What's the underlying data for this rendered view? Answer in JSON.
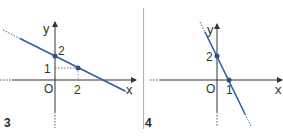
{
  "colors": {
    "line": "#2f5f9e",
    "point": "#2a4f8a",
    "axis": "#333333",
    "divider": "#b5b5b5",
    "dotted": "#555555"
  },
  "graph3": {
    "figure_label": "3",
    "x_axis_label": "x",
    "y_axis_label": "y",
    "origin_label": "O",
    "y_tick_2": "2",
    "y_tick_1": "1",
    "x_tick_2": "2",
    "points": [
      {
        "x": 0,
        "y": 2
      },
      {
        "x": 2,
        "y": 1
      }
    ]
  },
  "graph4": {
    "figure_label": "4",
    "x_axis_label": "x",
    "y_axis_label": "y",
    "origin_label": "O",
    "y_tick_2": "2",
    "x_tick_1": "1",
    "points": [
      {
        "x": 0,
        "y": 2
      },
      {
        "x": 1,
        "y": 0
      }
    ]
  }
}
